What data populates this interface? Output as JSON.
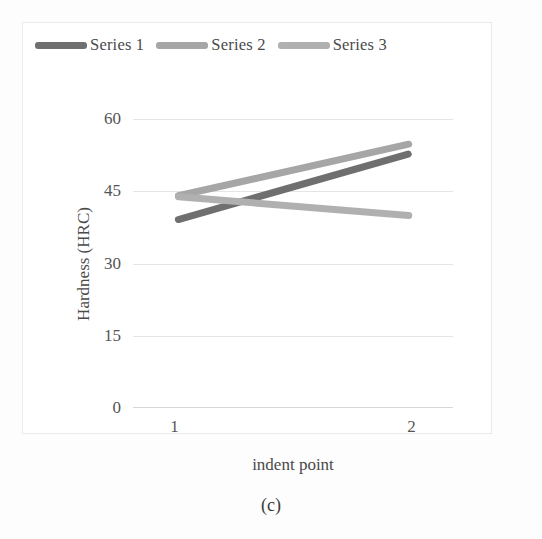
{
  "figure": {
    "caption": "(c)"
  },
  "chart_data": {
    "type": "line",
    "title": "",
    "xlabel": "indent point",
    "ylabel": "Hardness (HRC)",
    "categories": [
      "1",
      "2"
    ],
    "x_tick_labels": [
      "1",
      "2"
    ],
    "y_tick_labels": [
      "0",
      "15",
      "30",
      "45",
      "60"
    ],
    "y_ticks": [
      0,
      15,
      30,
      45,
      60
    ],
    "ylim": [
      0,
      60
    ],
    "grid": true,
    "legend_position": "top-left",
    "series": [
      {
        "name": "Series 1",
        "values": [
          39,
          53
        ],
        "color": "#6f6f6f"
      },
      {
        "name": "Series 2",
        "values": [
          44,
          55
        ],
        "color": "#a6a6a6"
      },
      {
        "name": "Series 3",
        "values": [
          44,
          40
        ],
        "color": "#b0b0b0"
      }
    ]
  },
  "legend": {
    "items": [
      {
        "label": "Series 1",
        "color": "#6f6f6f"
      },
      {
        "label": "Series 2",
        "color": "#a6a6a6"
      },
      {
        "label": "Series 3",
        "color": "#b0b0b0"
      }
    ]
  }
}
